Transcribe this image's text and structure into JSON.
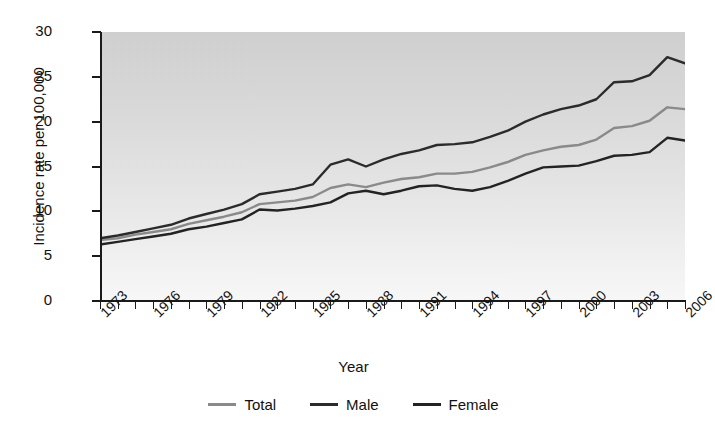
{
  "chart_data": {
    "type": "line",
    "title": "",
    "xlabel": "Year",
    "ylabel": "Incidence rate per 100,000",
    "ylim": [
      0,
      30
    ],
    "xlim": [
      1973,
      2006
    ],
    "yticks": [
      0,
      5,
      10,
      15,
      20,
      25,
      30
    ],
    "xtick_labels": [
      "1973",
      "1976",
      "1979",
      "1982",
      "1985",
      "1988",
      "1991",
      "1994",
      "1997",
      "2000",
      "2003",
      "2006"
    ],
    "xtick_step": 1,
    "grid": false,
    "legend_position": "bottom",
    "x": [
      1973,
      1974,
      1975,
      1976,
      1977,
      1978,
      1979,
      1980,
      1981,
      1982,
      1983,
      1984,
      1985,
      1986,
      1987,
      1988,
      1989,
      1990,
      1991,
      1992,
      1993,
      1994,
      1995,
      1996,
      1997,
      1998,
      1999,
      2000,
      2001,
      2002,
      2003,
      2004,
      2005,
      2006
    ],
    "series": [
      {
        "name": "Total",
        "color": "#8a8a8a",
        "values": [
          6.8,
          7.0,
          7.4,
          7.7,
          8.0,
          8.6,
          9.0,
          9.4,
          9.9,
          10.8,
          11.0,
          11.2,
          11.6,
          12.6,
          13.0,
          12.7,
          13.2,
          13.6,
          13.8,
          14.2,
          14.2,
          14.4,
          14.9,
          15.5,
          16.3,
          16.8,
          17.2,
          17.4,
          18.0,
          19.3,
          19.5,
          20.1,
          21.6,
          21.4
        ]
      },
      {
        "name": "Male",
        "color": "#2b2b2b",
        "values": [
          7.0,
          7.3,
          7.7,
          8.1,
          8.5,
          9.2,
          9.7,
          10.2,
          10.8,
          11.9,
          12.2,
          12.5,
          13.0,
          15.2,
          15.8,
          15.0,
          15.8,
          16.4,
          16.8,
          17.4,
          17.5,
          17.7,
          18.3,
          19.0,
          20.0,
          20.8,
          21.4,
          21.8,
          22.5,
          24.4,
          24.5,
          25.2,
          27.2,
          26.5
        ]
      },
      {
        "name": "Female",
        "color": "#232323",
        "values": [
          6.3,
          6.6,
          6.9,
          7.2,
          7.5,
          8.0,
          8.3,
          8.7,
          9.1,
          10.2,
          10.1,
          10.3,
          10.6,
          11.0,
          12.0,
          12.3,
          11.9,
          12.3,
          12.8,
          12.9,
          12.5,
          12.3,
          12.7,
          13.4,
          14.2,
          14.9,
          15.0,
          15.1,
          15.6,
          16.2,
          16.3,
          16.6,
          18.2,
          17.9
        ]
      }
    ]
  },
  "legend": {
    "items": [
      {
        "label": "Total"
      },
      {
        "label": "Male"
      },
      {
        "label": "Female"
      }
    ]
  }
}
